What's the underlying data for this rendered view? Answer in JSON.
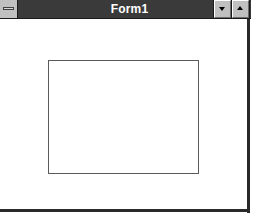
{
  "window": {
    "title": "Form1",
    "controls": {
      "control_menu_icon": "control-menu-bar-icon",
      "minimize_icon": "triangle-down-icon",
      "maximize_icon": "triangle-up-icon"
    },
    "colors": {
      "titlebar": "#3a3a3a",
      "title_text": "#ffffff",
      "button_face": "#c0c0c0",
      "frame": "#2a2a2a",
      "client_bg": "#ffffff",
      "inner_rect_border": "#5a5a5a"
    }
  },
  "client": {
    "inner_rect": {
      "label": ""
    }
  }
}
